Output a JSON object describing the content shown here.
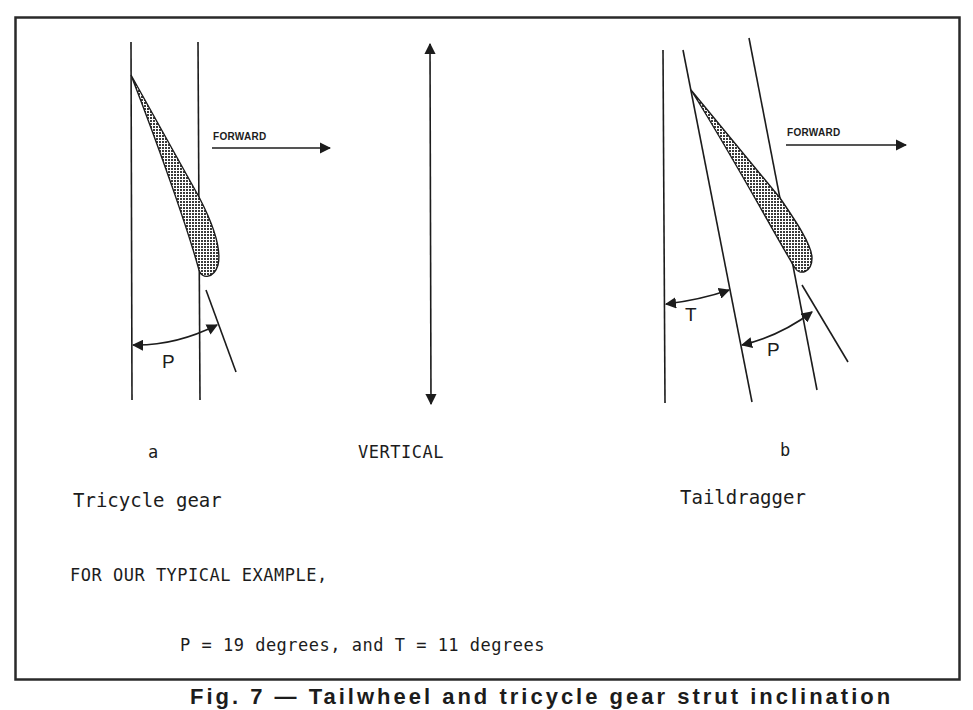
{
  "figure": {
    "border_color": "#2a2a2a",
    "ink_color": "#1c1c1c",
    "fill_pattern": "crosshatch-dots",
    "diagram_a": {
      "letter": "a",
      "title": "Tricycle gear",
      "angle_label": "P",
      "direction_label": "FORWARD"
    },
    "center": {
      "label": "VERTICAL"
    },
    "diagram_b": {
      "letter": "b",
      "title": "Taildragger",
      "angle_label_t": "T",
      "angle_label_p": "P",
      "direction_label": "FORWARD"
    },
    "example": {
      "intro": "FOR OUR TYPICAL EXAMPLE,",
      "values": "P = 19 degrees, and T = 11 degrees",
      "p_degrees": 19,
      "t_degrees": 11
    },
    "caption_cropped": "Fig. 7 — Tailwheel and tricycle gear strut inclination"
  }
}
